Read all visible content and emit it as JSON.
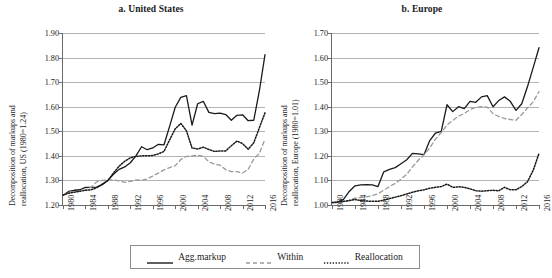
{
  "figure": {
    "legend": {
      "entries": [
        {
          "label": "Agg.markup",
          "style": "solid",
          "color": "#1a1a1a"
        },
        {
          "label": "Within",
          "style": "dashed",
          "color": "#8a8a8a"
        },
        {
          "label": "Reallocation",
          "style": "dotted",
          "color": "#1a1a1a"
        }
      ]
    }
  },
  "chart_data": [
    {
      "type": "line",
      "title": "a. United States",
      "ylabel_line1": "Decomposition of markups and",
      "ylabel_line2": "reallocation, US (1980=1.24)",
      "xlabel": "",
      "ylim": [
        1.2,
        1.9
      ],
      "yticks": [
        "1.20",
        "1.30",
        "1.40",
        "1.50",
        "1.60",
        "1.70",
        "1.80",
        "1.90"
      ],
      "xlim": [
        1980,
        2016
      ],
      "xticks": [
        "1980",
        "1984",
        "1988",
        "1992",
        "1996",
        "2000",
        "2004",
        "2008",
        "2012",
        "2016"
      ],
      "grid": true,
      "legend_position": "below",
      "x": [
        1980,
        1981,
        1982,
        1983,
        1984,
        1985,
        1986,
        1987,
        1988,
        1989,
        1990,
        1991,
        1992,
        1993,
        1994,
        1995,
        1996,
        1997,
        1998,
        1999,
        2000,
        2001,
        2002,
        2003,
        2004,
        2005,
        2006,
        2007,
        2008,
        2009,
        2010,
        2011,
        2012,
        2013,
        2014,
        2015,
        2016
      ],
      "series": [
        {
          "name": "Agg.markup",
          "style": "solid",
          "values": [
            1.24,
            1.255,
            1.26,
            1.262,
            1.272,
            1.272,
            1.273,
            1.283,
            1.3,
            1.325,
            1.345,
            1.355,
            1.372,
            1.4,
            1.437,
            1.425,
            1.432,
            1.447,
            1.445,
            1.52,
            1.598,
            1.638,
            1.645,
            1.525,
            1.612,
            1.622,
            1.577,
            1.572,
            1.574,
            1.568,
            1.545,
            1.565,
            1.567,
            1.543,
            1.545,
            1.665,
            1.812
          ]
        },
        {
          "name": "Within",
          "style": "dashed",
          "values": [
            1.24,
            1.252,
            1.254,
            1.256,
            1.262,
            1.272,
            1.294,
            1.3,
            1.303,
            1.302,
            1.298,
            1.292,
            1.296,
            1.302,
            1.3,
            1.306,
            1.318,
            1.33,
            1.343,
            1.352,
            1.36,
            1.385,
            1.398,
            1.4,
            1.403,
            1.398,
            1.376,
            1.366,
            1.362,
            1.344,
            1.336,
            1.336,
            1.33,
            1.345,
            1.387,
            1.41,
            1.468
          ]
        },
        {
          "name": "Reallocation",
          "style": "dotted",
          "values": [
            1.24,
            1.248,
            1.252,
            1.256,
            1.26,
            1.262,
            1.27,
            1.285,
            1.3,
            1.33,
            1.358,
            1.378,
            1.392,
            1.398,
            1.4,
            1.4,
            1.402,
            1.408,
            1.418,
            1.465,
            1.51,
            1.532,
            1.502,
            1.432,
            1.428,
            1.435,
            1.426,
            1.418,
            1.42,
            1.42,
            1.441,
            1.46,
            1.45,
            1.427,
            1.453,
            1.515,
            1.575
          ]
        }
      ]
    },
    {
      "type": "line",
      "title": "b. Europe",
      "ylabel_line1": "Decomposition of markups and",
      "ylabel_line2": "reallocation, Europe (1980=1.01)",
      "xlabel": "",
      "ylim": [
        1.0,
        1.7
      ],
      "yticks": [
        "1.00",
        "1.10",
        "1.20",
        "1.30",
        "1.40",
        "1.50",
        "1.60",
        "1.70"
      ],
      "xlim": [
        1980,
        2016
      ],
      "xticks": [
        "1980",
        "1984",
        "1988",
        "1992",
        "1996",
        "2000",
        "2004",
        "2008",
        "2012",
        "2016"
      ],
      "grid": true,
      "legend_position": "below",
      "x": [
        1980,
        1981,
        1982,
        1983,
        1984,
        1985,
        1986,
        1987,
        1988,
        1989,
        1990,
        1991,
        1992,
        1993,
        1994,
        1995,
        1996,
        1997,
        1998,
        1999,
        2000,
        2001,
        2002,
        2003,
        2004,
        2005,
        2006,
        2007,
        2008,
        2009,
        2010,
        2011,
        2012,
        2013,
        2014,
        2015,
        2016
      ],
      "series": [
        {
          "name": "Agg.markup",
          "style": "solid",
          "values": [
            1.01,
            1.012,
            1.023,
            1.055,
            1.078,
            1.082,
            1.083,
            1.082,
            1.075,
            1.135,
            1.145,
            1.152,
            1.168,
            1.184,
            1.21,
            1.208,
            1.205,
            1.262,
            1.293,
            1.3,
            1.408,
            1.38,
            1.4,
            1.392,
            1.422,
            1.418,
            1.44,
            1.445,
            1.4,
            1.425,
            1.44,
            1.422,
            1.385,
            1.412,
            1.482,
            1.56,
            1.64
          ]
        },
        {
          "name": "Within",
          "style": "dashed",
          "values": [
            1.01,
            1.008,
            1.012,
            1.018,
            1.028,
            1.03,
            1.033,
            1.038,
            1.046,
            1.06,
            1.075,
            1.088,
            1.105,
            1.125,
            1.155,
            1.182,
            1.205,
            1.232,
            1.268,
            1.295,
            1.325,
            1.344,
            1.362,
            1.372,
            1.388,
            1.398,
            1.4,
            1.398,
            1.372,
            1.36,
            1.352,
            1.348,
            1.345,
            1.368,
            1.395,
            1.42,
            1.462
          ]
        },
        {
          "name": "Reallocation",
          "style": "dotted",
          "values": [
            1.01,
            1.012,
            1.015,
            1.018,
            1.022,
            1.018,
            1.016,
            1.015,
            1.015,
            1.02,
            1.026,
            1.032,
            1.038,
            1.045,
            1.052,
            1.058,
            1.062,
            1.068,
            1.072,
            1.075,
            1.085,
            1.072,
            1.074,
            1.072,
            1.066,
            1.058,
            1.056,
            1.058,
            1.06,
            1.058,
            1.072,
            1.062,
            1.062,
            1.075,
            1.095,
            1.142,
            1.21
          ]
        }
      ]
    }
  ]
}
